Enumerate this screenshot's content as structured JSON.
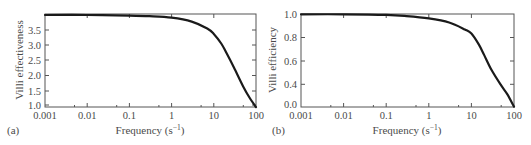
{
  "chart_data": [
    {
      "panel": "(a)",
      "type": "line",
      "xlabel": "Frequency (s⁻¹)",
      "ylabel": "Villi effectiveness",
      "xscale": "log",
      "xlim": [
        0.001,
        100
      ],
      "ylim": [
        0.93,
        4.02
      ],
      "xticks": [
        "0.001",
        "0.01",
        "0.1",
        "1",
        "10",
        "100"
      ],
      "yticks": [
        "1.0",
        "1.5",
        "2.0",
        "2.5",
        "3.0",
        "3.5"
      ],
      "grid": false,
      "legend": null,
      "series": [
        {
          "name": "Villi effectiveness",
          "x": [
            0.001,
            0.01,
            0.1,
            0.3,
            1,
            3,
            7,
            10,
            15,
            20,
            30,
            50,
            70,
            100
          ],
          "y": [
            4.0,
            4.0,
            3.98,
            3.96,
            3.91,
            3.78,
            3.55,
            3.37,
            3.05,
            2.73,
            2.25,
            1.61,
            1.25,
            0.93
          ]
        }
      ]
    },
    {
      "panel": "(b)",
      "type": "line",
      "xlabel": "Frequency (s⁻¹)",
      "ylabel": "Villi efficiency",
      "xscale": "log",
      "xlim": [
        0.001,
        100
      ],
      "ylim": [
        0.0,
        1.0
      ],
      "xticks": [
        "0.001",
        "0.01",
        "0.1",
        "1",
        "10",
        "100"
      ],
      "yticks": [
        "0.0",
        "0.4",
        "0.6",
        "0.8",
        "1.0"
      ],
      "grid": false,
      "legend": null,
      "series": [
        {
          "name": "Villi efficiency",
          "x": [
            0.001,
            0.01,
            0.1,
            0.3,
            1,
            3,
            7,
            10,
            15,
            20,
            30,
            50,
            70,
            100
          ],
          "y": [
            1.0,
            1.0,
            0.995,
            0.985,
            0.965,
            0.93,
            0.87,
            0.835,
            0.74,
            0.65,
            0.52,
            0.38,
            0.22,
            0.0
          ]
        }
      ]
    }
  ],
  "panels": {
    "a": {
      "label": "(a)",
      "ylabel": "Villi effectiveness",
      "xlabel": "Frequency (s⁻¹)",
      "xticks": [
        "0.001",
        "0.01",
        "0.1",
        "1",
        "10",
        "100"
      ],
      "yticks": [
        "3.5",
        "3.0",
        "2.5",
        "2.0",
        "1.5",
        "1.0"
      ]
    },
    "b": {
      "label": "(b)",
      "ylabel": "Villi efficiency",
      "xlabel": "Frequency (s⁻¹)",
      "xticks": [
        "0.001",
        "0.01",
        "0.1",
        "1",
        "10",
        "100"
      ],
      "yticks": [
        "1.0",
        "0.8",
        "0.6",
        "0.4",
        "0.0"
      ]
    }
  }
}
